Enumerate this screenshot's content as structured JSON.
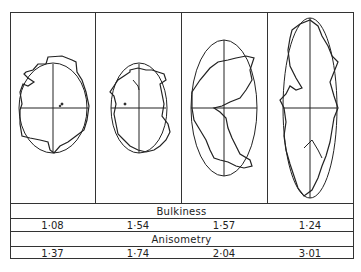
{
  "figure": {
    "panels": [
      {
        "id": 1,
        "shape": "rounded irregular particle with inscribed ellipse (near-circular)"
      },
      {
        "id": 2,
        "shape": "irregular particle with ellipse"
      },
      {
        "id": 3,
        "shape": "elongated irregular particle with ellipse"
      },
      {
        "id": 4,
        "shape": "highly elongated irregular particle with slender ellipse"
      }
    ]
  },
  "table": {
    "bulkiness": {
      "label": "Bulkiness",
      "values": [
        "1·08",
        "1·54",
        "1·57",
        "1·24"
      ]
    },
    "anisometry": {
      "label": "Anisometry",
      "values": [
        "1·37",
        "1·74",
        "2·04",
        "3·01"
      ]
    }
  },
  "colors": {
    "line": "#222222",
    "background": "#ffffff"
  }
}
